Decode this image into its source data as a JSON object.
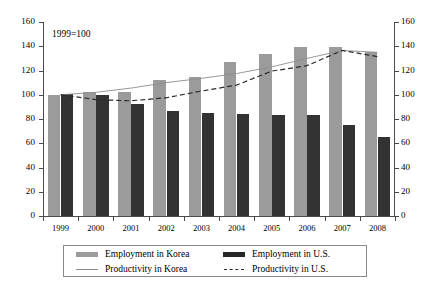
{
  "chart_data": {
    "type": "bar",
    "title": "",
    "subtitle": "",
    "annotation": "1999=100",
    "xlabel": "",
    "ylabel": "",
    "ylim": [
      0,
      160
    ],
    "yticks": [
      0,
      20,
      40,
      60,
      80,
      100,
      120,
      140,
      160
    ],
    "dual_axis": true,
    "right_ylim": [
      0,
      160
    ],
    "right_yticks": [
      0,
      20,
      40,
      60,
      80,
      100,
      120,
      140,
      160
    ],
    "grid": false,
    "legend_position": "bottom",
    "categories": [
      "1999",
      "2000",
      "2001",
      "2002",
      "2003",
      "2004",
      "2005",
      "2006",
      "2007",
      "2008"
    ],
    "series": [
      {
        "name": "Employment in Korea",
        "kind": "bar",
        "color": "#9b9b9b",
        "values": [
          100,
          102.5,
          102.5,
          112,
          114.5,
          127,
          134,
          139.5,
          139.5,
          135.5
        ]
      },
      {
        "name": "Employment in U.S.",
        "kind": "bar",
        "color": "#333333",
        "values": [
          100.5,
          100,
          92,
          87,
          85,
          84,
          83,
          83,
          75,
          65.5
        ]
      },
      {
        "name": "Productivity in Korea",
        "kind": "line",
        "style": "solid",
        "color": "#8d8d8d",
        "values": [
          100,
          102,
          105.5,
          110,
          113.5,
          117.5,
          123,
          130,
          136.5,
          135
        ]
      },
      {
        "name": "Productivity in U.S.",
        "kind": "line",
        "style": "dashed",
        "color": "#2b2b2b",
        "values": [
          100,
          96,
          95,
          97.5,
          103,
          108,
          119.5,
          124,
          136.5,
          131.5
        ]
      }
    ]
  },
  "legend": {
    "entries": [
      {
        "label": "Employment in Korea",
        "swatch": "bar-korea-swatch"
      },
      {
        "label": "Employment in U.S.",
        "swatch": "bar-us-swatch"
      },
      {
        "label": "Productivity in Korea",
        "swatch": "line-korea-swatch"
      },
      {
        "label": "Productivity in U.S.",
        "swatch": "line-us-swatch"
      }
    ]
  }
}
